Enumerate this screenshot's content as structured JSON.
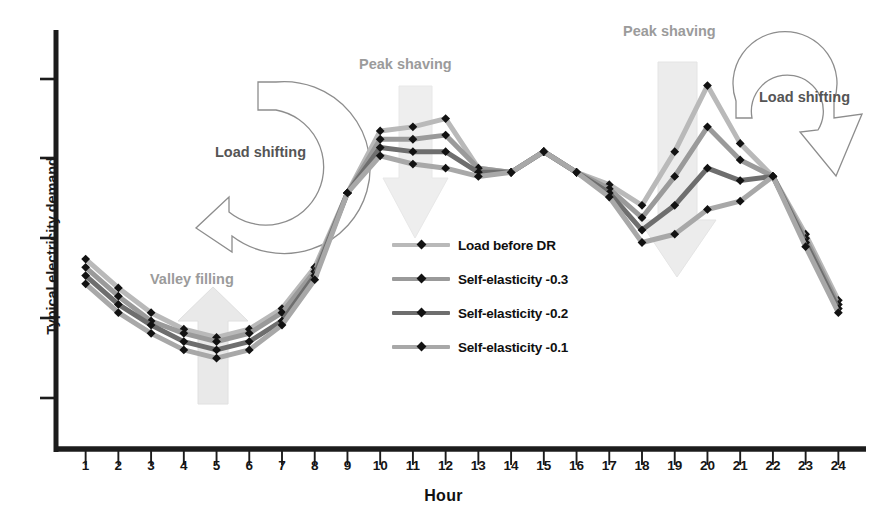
{
  "chart_data": {
    "type": "line",
    "title": "",
    "xlabel": "Hour",
    "ylabel": "Typical electricity demand",
    "categories": [
      1,
      2,
      3,
      4,
      5,
      6,
      7,
      8,
      9,
      10,
      11,
      12,
      13,
      14,
      15,
      16,
      17,
      18,
      19,
      20,
      21,
      22,
      23,
      24
    ],
    "xlim": [
      0.4,
      24.6
    ],
    "ylim": [
      0,
      100
    ],
    "grid": false,
    "legend_position": "center",
    "y_tick_count": 5,
    "y_ticks_labeled": false,
    "series": [
      {
        "name": "Load before DR",
        "color": "#b9b9b9",
        "marker": "diamond",
        "values": [
          46,
          39,
          33,
          29,
          27,
          29,
          34,
          44,
          62,
          77,
          78,
          80,
          68,
          67,
          72,
          67,
          64,
          59,
          72,
          88,
          74,
          66,
          52,
          36
        ]
      },
      {
        "name": "Self-elasticity -0.3",
        "color": "#9a9a9a",
        "marker": "diamond",
        "values": [
          44,
          37,
          31,
          28,
          26,
          28,
          33,
          43,
          62,
          75,
          75,
          76,
          68,
          67,
          72,
          67,
          63,
          56,
          66,
          78,
          70,
          66,
          51,
          35
        ]
      },
      {
        "name": "Self-elasticity -0.2",
        "color": "#6e6e6e",
        "marker": "diamond",
        "values": [
          42,
          35,
          30,
          26,
          24,
          26,
          31,
          42,
          62,
          73,
          72,
          72,
          67,
          67,
          72,
          67,
          62,
          53,
          59,
          68,
          65,
          66,
          50,
          34
        ]
      },
      {
        "name": "Self-elasticity -0.1",
        "color": "#a8a8a8",
        "marker": "diamond",
        "values": [
          40,
          33,
          28,
          24,
          22,
          24,
          30,
          41,
          62,
          71,
          69,
          68,
          66,
          67,
          72,
          67,
          61,
          50,
          52,
          58,
          60,
          66,
          49,
          33
        ]
      }
    ],
    "annotations": [
      {
        "id": "valley-filling",
        "text": "Valley filling",
        "kind": "label",
        "x": 150,
        "y": 279
      },
      {
        "id": "peak-shaving-midday",
        "text": "Peak shaving",
        "kind": "label",
        "x": 359,
        "y": 64
      },
      {
        "id": "peak-shaving-evening",
        "text": "Peak shaving",
        "kind": "label",
        "x": 623,
        "y": 31
      },
      {
        "id": "load-shifting-left",
        "text": "Load shifting",
        "kind": "label",
        "x": 215,
        "y": 152
      },
      {
        "id": "load-shifting-right",
        "text": "Load shifting",
        "kind": "label",
        "x": 759,
        "y": 97
      }
    ],
    "arrows": [
      {
        "id": "valley-filling-arrow",
        "direction": "up",
        "style": "block"
      },
      {
        "id": "peak-shaving-midday-arrow",
        "direction": "down",
        "style": "block"
      },
      {
        "id": "peak-shaving-evening-arrow",
        "direction": "down",
        "style": "block"
      },
      {
        "id": "load-shifting-left-arrow",
        "direction": "counterclockwise",
        "style": "outline-curved"
      },
      {
        "id": "load-shifting-right-arrow",
        "direction": "clockwise",
        "style": "outline-curved"
      }
    ]
  },
  "axis": {
    "y_title": "Typical electricity demand",
    "x_title": "Hour",
    "x_ticks": [
      "1",
      "2",
      "3",
      "4",
      "5",
      "6",
      "7",
      "8",
      "9",
      "10",
      "11",
      "12",
      "13",
      "14",
      "15",
      "16",
      "17",
      "18",
      "19",
      "20",
      "21",
      "22",
      "23",
      "24"
    ]
  },
  "legend": {
    "items": [
      {
        "label": "Load before DR",
        "color": "#b9b9b9"
      },
      {
        "label": "Self-elasticity -0.3",
        "color": "#9a9a9a"
      },
      {
        "label": "Self-elasticity -0.2",
        "color": "#6e6e6e"
      },
      {
        "label": "Self-elasticity -0.1",
        "color": "#a8a8a8"
      }
    ]
  },
  "annotations": {
    "valley_filling": "Valley filling",
    "peak_shaving_midday": "Peak shaving",
    "peak_shaving_evening": "Peak shaving",
    "load_shifting_left": "Load shifting",
    "load_shifting_right": "Load shifting"
  },
  "colors": {
    "axis": "#1c1c1c",
    "annotation_gray": "#9b9b9b",
    "arrow_fill": "#ebebeb",
    "arrow_stroke": "#8a8a8a",
    "background": "#ffffff"
  }
}
